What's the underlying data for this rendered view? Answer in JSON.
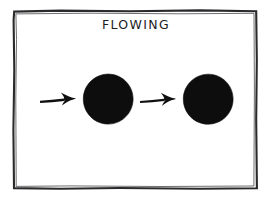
{
  "diagram": {
    "title": "FLOWING",
    "background_color": "#ffffff",
    "frame": {
      "name": "hand-drawn-rectangle-border",
      "color": "#2a2a2c",
      "left": 13,
      "top": 10,
      "right": 257,
      "bottom": 189
    },
    "shapes": [
      {
        "kind": "arrow",
        "label": "arrow-1",
        "direction": "right",
        "color": "#101010",
        "x_start": 40,
        "x_end": 78,
        "y": 99
      },
      {
        "kind": "circle",
        "label": "blob-1",
        "color": "#0d0d0d",
        "cx": 108,
        "cy": 99,
        "r": 25
      },
      {
        "kind": "arrow",
        "label": "arrow-2",
        "direction": "right",
        "color": "#101010",
        "x_start": 140,
        "x_end": 178,
        "y": 99
      },
      {
        "kind": "circle",
        "label": "blob-2",
        "color": "#0d0d0d",
        "cx": 208,
        "cy": 99,
        "r": 25
      }
    ]
  }
}
